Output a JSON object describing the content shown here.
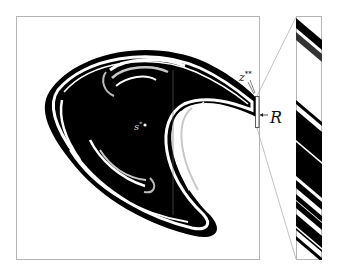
{
  "figure": {
    "type": "basin-of-attraction plot with magnified inset",
    "labels": {
      "saddle_point": "s",
      "saddle_point_sup": "*",
      "boundary_point": "z",
      "boundary_point_sup": "**",
      "region": "R",
      "region_arrow": "←"
    },
    "colors": {
      "basin": "#000000",
      "background": "#ffffff",
      "gray_band": "#bdbdbd",
      "frame": "#b0b0b0"
    },
    "panels": [
      {
        "name": "main-plot",
        "x": 16,
        "y": 16,
        "width": 244,
        "height": 244
      },
      {
        "name": "inset-zoom",
        "x": 296,
        "y": 16,
        "width": 26,
        "height": 244
      }
    ],
    "region_box": {
      "x": 255,
      "y": 96,
      "width": 4,
      "height": 32
    }
  }
}
